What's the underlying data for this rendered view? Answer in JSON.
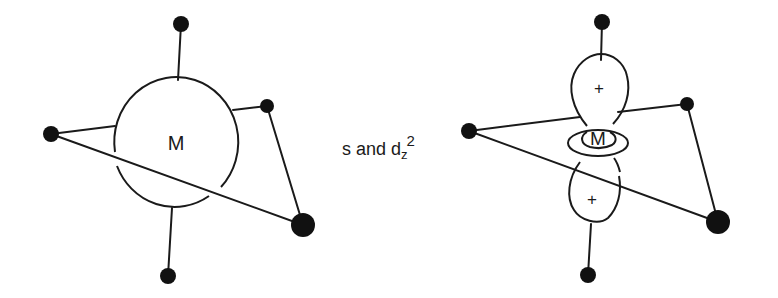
{
  "left_figure": {
    "metal_label": "M"
  },
  "caption": {
    "prefix": "s and d",
    "subscript": "z",
    "superscript": "2"
  },
  "right_figure": {
    "metal_label": "M",
    "upper_lobe_sign": "+",
    "lower_lobe_sign": "+"
  }
}
